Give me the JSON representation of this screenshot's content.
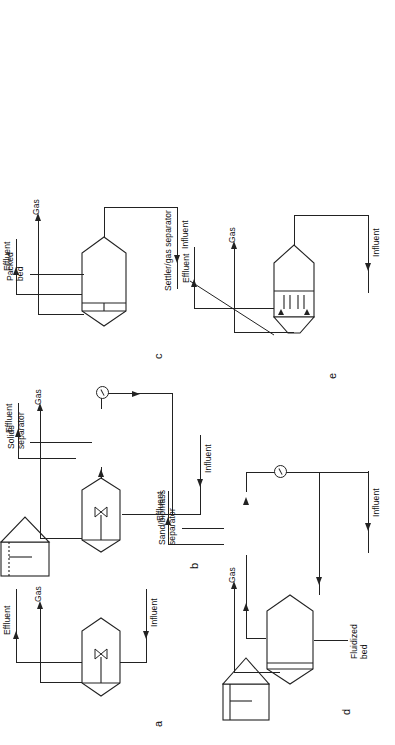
{
  "figure": {
    "orientation": "rotated-90-ccw",
    "background_color": "#ffffff",
    "line_color": "#222222"
  },
  "common_labels": {
    "gas": "Gas",
    "effluent": "Effluent",
    "influent": "Influent"
  },
  "panels": [
    {
      "letter": "a",
      "name": "completely-mixed-reactor",
      "gas": "Gas",
      "effluent": "Effluent",
      "influent": "Influent",
      "components": [
        "reactor-vessel",
        "impeller"
      ],
      "detail_labels": []
    },
    {
      "letter": "b",
      "name": "anaerobic-contact-process",
      "gas": "Gas",
      "effluent": "Effluent",
      "influent": "Influent",
      "components": [
        "reactor-vessel",
        "impeller",
        "solids-separator",
        "recycle-pump"
      ],
      "detail_labels": [
        "Solids separator"
      ],
      "separator_label_line1": "Solids",
      "separator_label_line2": "separator"
    },
    {
      "letter": "c",
      "name": "upflow-packed-bed-reactor",
      "gas": "Gas",
      "effluent": "Effluent",
      "influent": "Influent",
      "components": [
        "reactor-vessel",
        "packed-media"
      ],
      "detail_labels": [
        "Packed bed"
      ],
      "bed_label_line1": "Packed",
      "bed_label_line2": "bed"
    },
    {
      "letter": "d",
      "name": "fluidized-bed-reactor",
      "gas": "Gas",
      "effluent": "Effluent",
      "influent": "Influent",
      "components": [
        "reactor-vessel",
        "fluidized-media",
        "sand-biomass-separator",
        "recirculation-pump"
      ],
      "detail_labels": [
        "Fluidized bed",
        "Sand/biomass separator"
      ],
      "bed_label_line1": "Fluidized",
      "bed_label_line2": "bed",
      "separator_label_line1": "Sand/biomass",
      "separator_label_line2": "separator"
    },
    {
      "letter": "e",
      "name": "upflow-anaerobic-sludge-blanket-reactor",
      "gas": "Gas",
      "effluent": "Effluent",
      "influent": "Influent",
      "components": [
        "reactor-vessel",
        "sludge-blanket",
        "settler-gas-separator"
      ],
      "detail_labels": [
        "Settler/gas separator"
      ],
      "separator_label": "Settler/gas separator"
    }
  ]
}
